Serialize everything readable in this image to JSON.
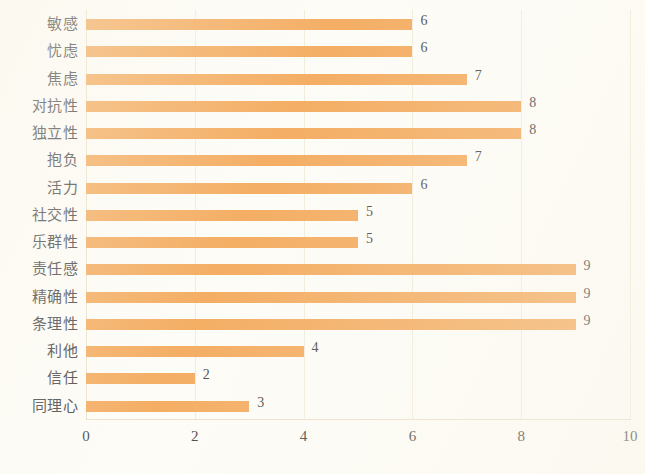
{
  "chart_data": {
    "type": "bar",
    "orientation": "horizontal",
    "title": "",
    "xlabel": "",
    "ylabel": "",
    "xlim": [
      0,
      10
    ],
    "xticks": [
      "0",
      "2",
      "4",
      "6",
      "8",
      "10"
    ],
    "grid": true,
    "legend": "none",
    "bar_color": "#F2A04A",
    "categories": [
      "敏感",
      "忧虑",
      "焦虑",
      "对抗性",
      "独立性",
      "抱负",
      "活力",
      "社交性",
      "乐群性",
      "责任感",
      "精确性",
      "条理性",
      "利他",
      "信任",
      "同理心"
    ],
    "values": [
      6,
      6,
      7,
      8,
      8,
      7,
      6,
      5,
      5,
      9,
      9,
      9,
      4,
      2,
      3
    ],
    "value_labels": [
      "6",
      "6",
      "7",
      "8",
      "8",
      "7",
      "6",
      "5",
      "5",
      "9",
      "9",
      "9",
      "4",
      "2",
      "3"
    ]
  },
  "colors": {
    "bar": "#F2A04A",
    "background": "#FDFCF7",
    "gridline": "#F0E9D8",
    "text": "#2C2C2E"
  }
}
